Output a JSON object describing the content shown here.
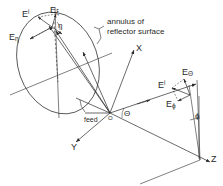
{
  "figure": {
    "stroke_color": "#2a2a2a",
    "background_color": "#ffffff"
  },
  "annotations": {
    "annulus_note_line1": "annulus of",
    "annulus_note_line2": "reflector surface",
    "feed_label": "feed",
    "origin_label": "O"
  },
  "axes": [
    {
      "name": "x-axis",
      "label": "X"
    },
    {
      "name": "y-axis",
      "label": "Y"
    },
    {
      "name": "z-axis",
      "label": "Z"
    }
  ],
  "angles": [
    {
      "name": "eta",
      "label": "η"
    },
    {
      "name": "theta",
      "label": "Θ"
    },
    {
      "name": "phi",
      "label": "ϕ"
    }
  ],
  "reflector_vectors": [
    {
      "name": "e-incident-reflector",
      "base": "E",
      "sup": "i",
      "sub": ""
    },
    {
      "name": "e-xi",
      "base": "E",
      "sup": "",
      "sub": "ξ"
    },
    {
      "name": "e-eta",
      "base": "E",
      "sup": "",
      "sub": "η"
    }
  ],
  "farfield_vectors": [
    {
      "name": "e-incident-farfield",
      "base": "E",
      "sup": "i",
      "sub": ""
    },
    {
      "name": "e-theta",
      "base": "E",
      "sup": "",
      "sub": "Θ"
    },
    {
      "name": "e-phi",
      "base": "E",
      "sup": "",
      "sub": "ϕ"
    }
  ]
}
